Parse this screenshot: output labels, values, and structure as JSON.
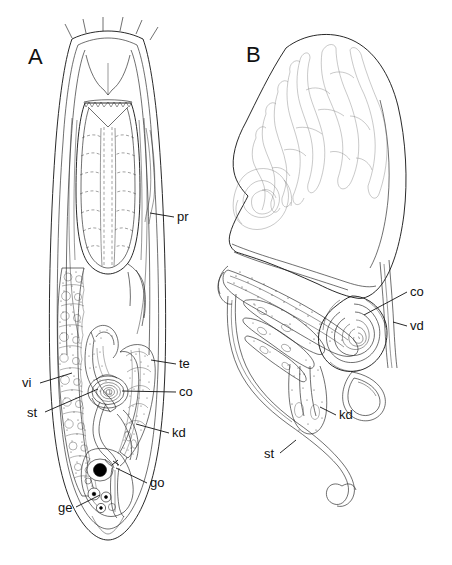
{
  "figure": {
    "type": "scientific-line-drawing",
    "background_color": "#ffffff",
    "ink_color": "#111111",
    "panels": [
      {
        "id": "A",
        "letter": "A",
        "description": "whole-body dorsal view of the worm showing pharynx, gut, vitellaria and copulatory apparatus",
        "letter_x": 28,
        "letter_y": 64
      },
      {
        "id": "B",
        "letter": "B",
        "description": "enlarged view of the copulatory bulb, stylet and associated ducts",
        "letter_x": 246,
        "letter_y": 62
      }
    ],
    "labels": [
      {
        "id": "pr",
        "text": "pr",
        "meaning": "pharynx",
        "panel": "A",
        "x": 177,
        "y": 221,
        "anchor": "start",
        "leader": [
          [
            174,
            217
          ],
          [
            160,
            215
          ],
          [
            150,
            213
          ]
        ]
      },
      {
        "id": "te",
        "text": "te",
        "meaning": "testis",
        "panel": "A",
        "x": 179,
        "y": 368,
        "anchor": "start",
        "leader": [
          [
            176,
            364
          ],
          [
            160,
            362
          ],
          [
            151,
            360
          ]
        ]
      },
      {
        "id": "co",
        "text": "co",
        "meaning": "copulatory organ",
        "panel": "A",
        "x": 179,
        "y": 396,
        "anchor": "start",
        "leader": [
          [
            176,
            392
          ],
          [
            150,
            392
          ],
          [
            122,
            391
          ]
        ]
      },
      {
        "id": "kd",
        "text": "kd",
        "meaning": "kidney / protonephridial lobes",
        "panel": "A",
        "x": 172,
        "y": 437,
        "anchor": "start",
        "leader": [
          [
            169,
            433
          ],
          [
            155,
            429
          ],
          [
            142,
            424
          ]
        ]
      },
      {
        "id": "go",
        "text": "go",
        "meaning": "gonopore",
        "panel": "A",
        "x": 150,
        "y": 487,
        "anchor": "start",
        "leader": [
          [
            147,
            483
          ],
          [
            130,
            477
          ],
          [
            116,
            471
          ]
        ]
      },
      {
        "id": "ge",
        "text": "ge",
        "meaning": "germarium",
        "panel": "A",
        "x": 58,
        "y": 512,
        "anchor": "start",
        "leader": [
          [
            74,
            507
          ],
          [
            88,
            501
          ],
          [
            100,
            496
          ]
        ]
      },
      {
        "id": "vi",
        "text": "vi",
        "meaning": "vitellaria",
        "panel": "A",
        "x": 22,
        "y": 387,
        "anchor": "start",
        "leader": [
          [
            38,
            383
          ],
          [
            56,
            378
          ],
          [
            70,
            374
          ]
        ]
      },
      {
        "id": "st",
        "text": "st",
        "meaning": "stylet",
        "panel": "A",
        "x": 27,
        "y": 417,
        "anchor": "start",
        "leader": [
          [
            43,
            412
          ],
          [
            70,
            400
          ],
          [
            96,
            390
          ]
        ]
      },
      {
        "id": "coB",
        "text": "co",
        "meaning": "copulatory organ",
        "panel": "B",
        "x": 410,
        "y": 296,
        "anchor": "start",
        "leader": [
          [
            407,
            292
          ],
          [
            386,
            300
          ],
          [
            365,
            314
          ]
        ]
      },
      {
        "id": "vd",
        "text": "vd",
        "meaning": "vas deferens",
        "panel": "B",
        "x": 410,
        "y": 330,
        "anchor": "start",
        "leader": [
          [
            407,
            326
          ],
          [
            399,
            323
          ],
          [
            393,
            322
          ]
        ]
      },
      {
        "id": "kdB",
        "text": "kd",
        "meaning": "kidney / protonephridial lobes",
        "panel": "B",
        "x": 339,
        "y": 419,
        "anchor": "start",
        "leader": [
          [
            336,
            415
          ],
          [
            327,
            411
          ],
          [
            321,
            408
          ]
        ]
      },
      {
        "id": "stB",
        "text": "st",
        "meaning": "stylet",
        "panel": "B",
        "x": 264,
        "y": 458,
        "anchor": "start",
        "leader": [
          [
            280,
            453
          ],
          [
            289,
            447
          ],
          [
            294,
            442
          ]
        ]
      }
    ],
    "legend_abbreviations": [
      {
        "abbr": "pr",
        "term": "pharynx"
      },
      {
        "abbr": "te",
        "term": "testis"
      },
      {
        "abbr": "co",
        "term": "copulatory organ"
      },
      {
        "abbr": "kd",
        "term": "kidney"
      },
      {
        "abbr": "go",
        "term": "gonopore"
      },
      {
        "abbr": "ge",
        "term": "germarium"
      },
      {
        "abbr": "vi",
        "term": "vitellaria"
      },
      {
        "abbr": "st",
        "term": "stylet"
      },
      {
        "abbr": "vd",
        "term": "vas deferens"
      }
    ]
  }
}
